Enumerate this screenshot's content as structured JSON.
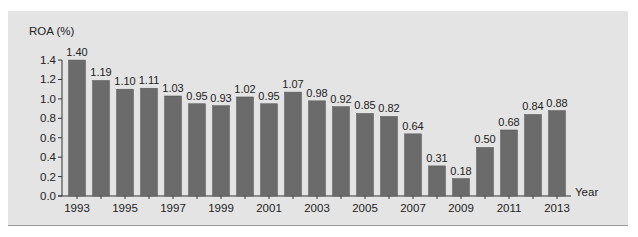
{
  "chart_data": {
    "type": "bar",
    "title": "",
    "xlabel": "Year",
    "ylabel": "ROA (%)",
    "ylim": [
      0,
      1.4
    ],
    "yticks": [
      "0.0",
      "0.2",
      "0.4",
      "0.6",
      "0.8",
      "1.0",
      "1.2",
      "1.4"
    ],
    "xtick_labels": [
      "1993",
      "1995",
      "1997",
      "1999",
      "2001",
      "2003",
      "2005",
      "2007",
      "2009",
      "2011",
      "2013"
    ],
    "grid": false,
    "legend": null,
    "categories": [
      "1993",
      "1994",
      "1995",
      "1996",
      "1997",
      "1998",
      "1999",
      "2000",
      "2001",
      "2002",
      "2003",
      "2004",
      "2005",
      "2006",
      "2007",
      "2008",
      "2009",
      "2010",
      "2011",
      "2012",
      "2013"
    ],
    "values": [
      1.4,
      1.19,
      1.1,
      1.11,
      1.03,
      0.95,
      0.93,
      1.02,
      0.95,
      1.07,
      0.98,
      0.92,
      0.85,
      0.82,
      0.64,
      0.31,
      0.18,
      0.5,
      0.68,
      0.84,
      0.88
    ],
    "value_labels": [
      "1.40",
      "1.19",
      "1.10",
      "1.11",
      "1.03",
      "0.95",
      "0.93",
      "1.02",
      "0.95",
      "1.07",
      "0.98",
      "0.92",
      "0.85",
      "0.82",
      "0.64",
      "0.31",
      "0.18",
      "0.50",
      "0.68",
      "0.84",
      "0.88"
    ],
    "colors": {
      "bar": "#6b6b6b",
      "panel": "#e4e4e4",
      "axis": "#333333"
    }
  }
}
